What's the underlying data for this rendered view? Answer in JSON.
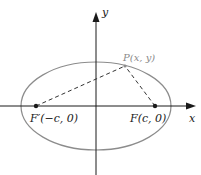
{
  "diagram": {
    "axes": {
      "x_label": "x",
      "y_label": "y",
      "origin": [
        96,
        106
      ]
    },
    "ellipse": {
      "cx": 96,
      "cy": 106,
      "rx": 75,
      "ry": 44,
      "stroke": "#8c8c8c"
    },
    "points": {
      "focus_left": {
        "label": "F′(−c, 0)",
        "x": 36,
        "y": 106
      },
      "focus_right": {
        "label": "F(c, 0)",
        "x": 155,
        "y": 106
      },
      "point_p": {
        "label": "P(x, y)",
        "x": 125,
        "y": 66
      }
    },
    "colors": {
      "axis": "#1a1a1a",
      "ellipse": "#8c8c8c",
      "p_label": "#8a8a8a",
      "dashed": "#333333"
    }
  }
}
